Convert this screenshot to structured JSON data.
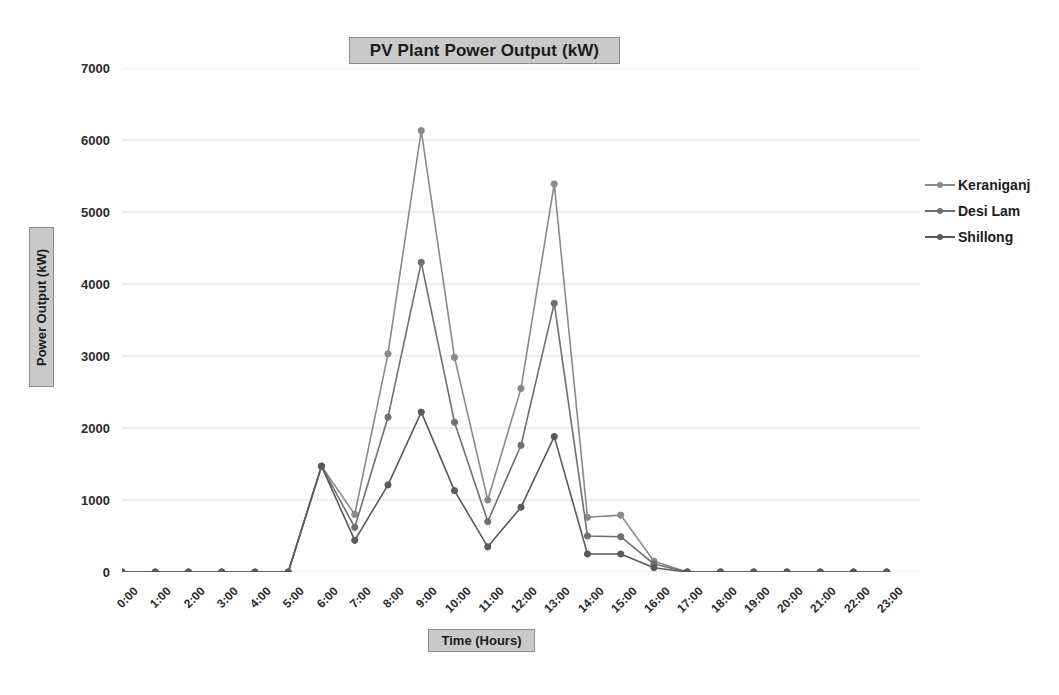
{
  "chart_data": {
    "type": "line",
    "title": "PV Plant Power Output (kW)",
    "xlabel": "Time (Hours)",
    "ylabel": "Power Output (kW)",
    "ylim": [
      0,
      7000
    ],
    "ytick_step": 1000,
    "yticks": [
      7000,
      6000,
      5000,
      4000,
      3000,
      2000,
      1000,
      0
    ],
    "grid": true,
    "grid_axis": "y",
    "legend_position": "right",
    "markers": "circle",
    "categories": [
      "0:00",
      "1:00",
      "2:00",
      "3:00",
      "4:00",
      "5:00",
      "6:00",
      "7:00",
      "8:00",
      "9:00",
      "10:00",
      "11:00",
      "12:00",
      "13:00",
      "14:00",
      "15:00",
      "16:00",
      "17:00",
      "18:00",
      "19:00",
      "20:00",
      "21:00",
      "22:00",
      "23:00"
    ],
    "series": [
      {
        "name": "Keraniganj",
        "color": "#8a8a8a",
        "values": [
          0,
          0,
          0,
          0,
          0,
          0,
          1470,
          800,
          3030,
          6130,
          2980,
          1000,
          2550,
          5390,
          760,
          790,
          150,
          0,
          0,
          0,
          0,
          0,
          0,
          0
        ]
      },
      {
        "name": "Desi Lam",
        "color": "#707070",
        "values": [
          0,
          0,
          0,
          0,
          0,
          0,
          1470,
          620,
          2150,
          4300,
          2080,
          700,
          1760,
          3730,
          500,
          490,
          110,
          0,
          0,
          0,
          0,
          0,
          0,
          0
        ]
      },
      {
        "name": "Shillong",
        "color": "#5a5a5a",
        "values": [
          0,
          0,
          0,
          0,
          0,
          0,
          1470,
          440,
          1210,
          2220,
          1130,
          350,
          900,
          1880,
          250,
          250,
          60,
          0,
          0,
          0,
          0,
          0,
          0,
          0
        ]
      }
    ]
  },
  "styling": {
    "title_box_bg": "#c9c9c9",
    "title_box_border": "#8d8d8d",
    "gridline_color": "#d9dde3",
    "plot_bg": "#ffffff",
    "text_color": "#2b2b2b"
  }
}
